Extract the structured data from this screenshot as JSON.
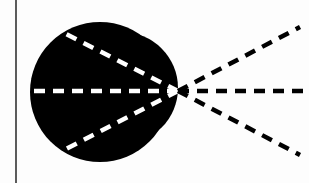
{
  "diagram": {
    "colors": {
      "background": "#fdfdfd",
      "blob": "#000000",
      "inner_rays": "#ffffff",
      "outer_rays": "#000000",
      "vertical_line": "#333333"
    },
    "vertical_line": {
      "x": 16,
      "y1": 0,
      "y2": 183
    },
    "focal_point": {
      "x": 178,
      "y": 91
    },
    "blob": {
      "main_circle": {
        "cx": 100,
        "cy": 92,
        "r": 70
      },
      "right_lobe": {
        "cx": 122,
        "cy": 88,
        "r": 56
      }
    },
    "inner_rays": [
      {
        "name": "upper",
        "x1": 178,
        "y1": 91,
        "x2": 62,
        "y2": 32
      },
      {
        "name": "middle",
        "x1": 178,
        "y1": 91,
        "x2": 28,
        "y2": 91
      },
      {
        "name": "lower",
        "x1": 178,
        "y1": 91,
        "x2": 64,
        "y2": 150
      }
    ],
    "outer_rays": [
      {
        "name": "upper",
        "x1": 178,
        "y1": 91,
        "x2": 300,
        "y2": 27
      },
      {
        "name": "middle",
        "x1": 178,
        "y1": 91,
        "x2": 309,
        "y2": 91
      },
      {
        "name": "lower",
        "x1": 178,
        "y1": 91,
        "x2": 300,
        "y2": 155
      }
    ]
  }
}
